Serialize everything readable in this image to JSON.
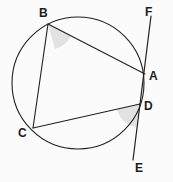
{
  "figure": {
    "background_color": "#fbfbfb",
    "stroke_color": "#231f20",
    "shade_color": "#e2e2e2",
    "label_color": "#1c1c1c"
  },
  "circle": {
    "name": "circumscribed-circle",
    "cx": 78,
    "cy": 83,
    "r": 66,
    "stroke_width": 1.1
  },
  "points": {
    "A": {
      "label": "A",
      "x": 145,
      "y": 74,
      "label_x": 149,
      "label_y": 70
    },
    "B": {
      "label": "B",
      "x": 48,
      "y": 24,
      "label_x": 39,
      "label_y": 7
    },
    "C": {
      "label": "C",
      "x": 33,
      "y": 128,
      "label_x": 18,
      "label_y": 127
    },
    "D": {
      "label": "D",
      "x": 140,
      "y": 104,
      "label_x": 144,
      "label_y": 100
    },
    "E": {
      "label": "E",
      "x": 133,
      "y": 160,
      "label_x": 135,
      "label_y": 162
    },
    "F": {
      "label": "F",
      "x": 151,
      "y": 16,
      "label_x": 145,
      "label_y": 6
    }
  },
  "segments": [
    {
      "name": "chord-ba",
      "from": "B",
      "to": "A",
      "x1": 48,
      "y1": 24,
      "x2": 145,
      "y2": 74
    },
    {
      "name": "chord-bc",
      "from": "B",
      "to": "C",
      "x1": 48,
      "y1": 24,
      "x2": 33,
      "y2": 128
    },
    {
      "name": "chord-cd",
      "from": "C",
      "to": "D",
      "x1": 33,
      "y1": 128,
      "x2": 140,
      "y2": 104
    },
    {
      "name": "line-fe",
      "from": "F",
      "to": "E",
      "x1": 151,
      "y1": 16,
      "x2": 133,
      "y2": 160
    }
  ],
  "angle_marks": [
    {
      "name": "angle-abd-shade",
      "vertex": "B",
      "path": "M 48 24 L 71 36 A 26 26 0 0 1 55 49 Z"
    },
    {
      "name": "angle-cde-shade",
      "vertex": "D",
      "path": "M 140 104 L 117 109 A 23 23 0 0 0 136 127 Z"
    }
  ],
  "labels_order": [
    "B",
    "F",
    "A",
    "D",
    "C",
    "E"
  ]
}
